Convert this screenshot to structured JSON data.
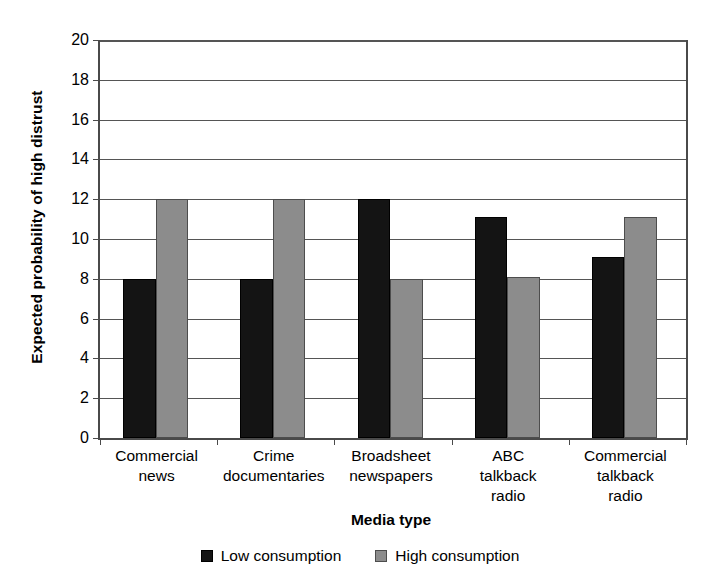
{
  "chart_data": {
    "type": "bar",
    "title": "",
    "subtitle": "",
    "xlabel": "Media type",
    "ylabel": "Expected probability of high distrust",
    "categories": [
      "Commercial\nnews",
      "Crime\ndocumentaries",
      "Broadsheet\nnewspapers",
      "ABC\ntalkback\nradio",
      "Commercial\ntalkback\nradio"
    ],
    "series": [
      {
        "name": "Low consumption",
        "color": "#141414",
        "values": [
          8,
          8,
          12,
          11.1,
          9.1
        ]
      },
      {
        "name": "High consumption",
        "color": "#8c8c8c",
        "values": [
          12,
          12,
          8,
          8.1,
          11.1
        ]
      }
    ],
    "ylim": [
      0,
      20
    ],
    "ytick_step": 2,
    "yticks": [
      0,
      2,
      4,
      6,
      8,
      10,
      12,
      14,
      16,
      18,
      20
    ],
    "yticklabels": [
      "0",
      "2",
      "4",
      "6",
      "8",
      "10",
      "12",
      "14",
      "16",
      "18",
      "20"
    ],
    "grid": "horizontal",
    "legend_position": "bottom-center"
  },
  "legend": {
    "items": [
      {
        "label": "Low consumption",
        "swatch": "black-square-icon"
      },
      {
        "label": "High consumption",
        "swatch": "gray-square-icon"
      }
    ]
  },
  "axes": {
    "y_title": "Expected probability of high distrust",
    "x_title": "Media type"
  }
}
